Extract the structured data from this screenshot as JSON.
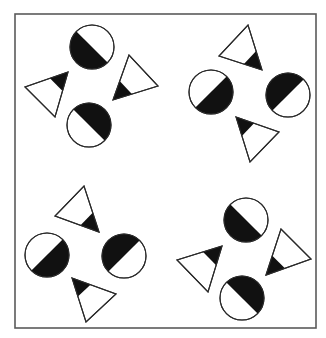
{
  "figure": {
    "width": 326,
    "height": 338,
    "frame": {
      "x": 15,
      "y": 14,
      "width": 301,
      "height": 314,
      "stroke": "#5a5a5a"
    },
    "colors": {
      "fill_dark": "#111111",
      "fill_light": "#ffffff",
      "outline": "#2a2a2a"
    },
    "groups": [
      {
        "name": "top-left-group",
        "circles": [
          {
            "name": "circle-top",
            "cx": 92,
            "cy": 47,
            "r": 22,
            "black_angle": 135
          },
          {
            "name": "circle-bottom",
            "cx": 89,
            "cy": 125,
            "r": 22,
            "black_angle": -45
          }
        ],
        "triangles": [
          {
            "name": "triangle-left",
            "points": [
              [
                68,
                72
              ],
              [
                25,
                87
              ],
              [
                55,
                117
              ]
            ],
            "black_vertex": 0,
            "black_fraction": 0.42
          },
          {
            "name": "triangle-right",
            "points": [
              [
                113,
                100
              ],
              [
                129,
                55
              ],
              [
                158,
                86
              ]
            ],
            "black_vertex": 0,
            "black_fraction": 0.42
          }
        ]
      },
      {
        "name": "top-right-group",
        "circles": [
          {
            "name": "circle-left",
            "cx": 211,
            "cy": 92,
            "r": 22,
            "black_angle": 45
          },
          {
            "name": "circle-right",
            "cx": 288,
            "cy": 95,
            "r": 22,
            "black_angle": 225
          }
        ],
        "triangles": [
          {
            "name": "triangle-top",
            "points": [
              [
                262,
                70
              ],
              [
                248,
                25
              ],
              [
                219,
                56
              ]
            ],
            "black_vertex": 0,
            "black_fraction": 0.42
          },
          {
            "name": "triangle-bottom",
            "points": [
              [
                236,
                117
              ],
              [
                279,
                132
              ],
              [
                250,
                162
              ]
            ],
            "black_vertex": 0,
            "black_fraction": 0.42
          }
        ]
      },
      {
        "name": "bottom-left-group",
        "circles": [
          {
            "name": "circle-left",
            "cx": 47,
            "cy": 255,
            "r": 22,
            "black_angle": 45
          },
          {
            "name": "circle-right",
            "cx": 124,
            "cy": 256,
            "r": 22,
            "black_angle": 225
          }
        ],
        "triangles": [
          {
            "name": "triangle-top",
            "points": [
              [
                99,
                232
              ],
              [
                84,
                186
              ],
              [
                55,
                216
              ]
            ],
            "black_vertex": 0,
            "black_fraction": 0.42
          },
          {
            "name": "triangle-bottom",
            "points": [
              [
                72,
                278
              ],
              [
                116,
                294
              ],
              [
                86,
                322
              ]
            ],
            "black_vertex": 0,
            "black_fraction": 0.42
          }
        ]
      },
      {
        "name": "bottom-right-group",
        "circles": [
          {
            "name": "circle-top",
            "cx": 246,
            "cy": 220,
            "r": 22,
            "black_angle": 135
          },
          {
            "name": "circle-bottom",
            "cx": 242,
            "cy": 298,
            "r": 22,
            "black_angle": -45
          }
        ],
        "triangles": [
          {
            "name": "triangle-left",
            "points": [
              [
                222,
                246
              ],
              [
                177,
                260
              ],
              [
                208,
                292
              ]
            ],
            "black_vertex": 0,
            "black_fraction": 0.42
          },
          {
            "name": "triangle-right",
            "points": [
              [
                266,
                275
              ],
              [
                281,
                229
              ],
              [
                311,
                259
              ]
            ],
            "black_vertex": 0,
            "black_fraction": 0.42
          }
        ]
      }
    ]
  }
}
